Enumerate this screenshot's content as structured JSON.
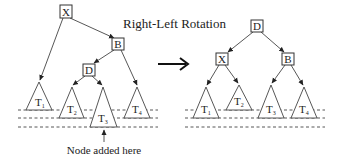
{
  "title": "Right-Left Rotation",
  "annotation": "Node added here",
  "transform_arrow": "rotation-arrow",
  "before_tree": {
    "nodes": [
      {
        "id": "X",
        "label": "X"
      },
      {
        "id": "B",
        "label": "B"
      },
      {
        "id": "D",
        "label": "D"
      }
    ],
    "subtrees": [
      {
        "id": "T1",
        "label": "T",
        "sub": "1"
      },
      {
        "id": "T2",
        "label": "T",
        "sub": "2"
      },
      {
        "id": "T3",
        "label": "T",
        "sub": "3"
      },
      {
        "id": "T4",
        "label": "T",
        "sub": "4"
      }
    ]
  },
  "after_tree": {
    "nodes": [
      {
        "id": "D",
        "label": "D"
      },
      {
        "id": "X",
        "label": "X"
      },
      {
        "id": "B",
        "label": "B"
      }
    ],
    "subtrees": [
      {
        "id": "T1",
        "label": "T",
        "sub": "1"
      },
      {
        "id": "T2",
        "label": "T",
        "sub": "2"
      },
      {
        "id": "T3",
        "label": "T",
        "sub": "3"
      },
      {
        "id": "T4",
        "label": "T",
        "sub": "4"
      }
    ]
  }
}
